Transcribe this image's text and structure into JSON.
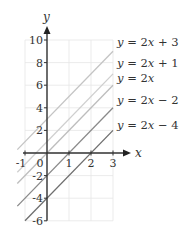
{
  "chart_data": {
    "type": "line",
    "title": "",
    "xlabel": "x",
    "ylabel": "y",
    "xlim": [
      -1,
      3
    ],
    "ylim": [
      -6,
      10
    ],
    "x_ticks": [
      -1,
      0,
      1,
      2,
      3
    ],
    "x_tick_labels": [
      "-1",
      "0",
      "1",
      "2",
      "3"
    ],
    "y_ticks": [
      -6,
      -4,
      -2,
      2,
      4,
      6,
      8,
      10
    ],
    "y_tick_labels": [
      "-6",
      "-4",
      "-2",
      "2",
      "4",
      "6",
      "8",
      "10"
    ],
    "grid": true,
    "legend_position": "right",
    "series": [
      {
        "name": "y = 2x + 3",
        "slope": 2,
        "intercept": 3,
        "color": "#c4c4c4",
        "label_parts": [
          "y",
          " = 2",
          "x",
          " + 3"
        ]
      },
      {
        "name": "y = 2x + 1",
        "slope": 2,
        "intercept": 1,
        "color": "#cfcfcf",
        "label_parts": [
          "y",
          " = 2",
          "x",
          " + 1"
        ]
      },
      {
        "name": "y = 2x",
        "slope": 2,
        "intercept": 0,
        "color": "#bdbdbd",
        "label_parts": [
          "y",
          " = 2",
          "x",
          ""
        ]
      },
      {
        "name": "y = 2x - 2",
        "slope": 2,
        "intercept": -2,
        "color": "#8a8a8a",
        "label_parts": [
          "y",
          " = 2",
          "x",
          " − 2"
        ]
      },
      {
        "name": "y = 2x - 4",
        "slope": 2,
        "intercept": -4,
        "color": "#6e6e6e",
        "label_parts": [
          "y",
          " = 2",
          "x",
          " − 4"
        ]
      }
    ]
  }
}
